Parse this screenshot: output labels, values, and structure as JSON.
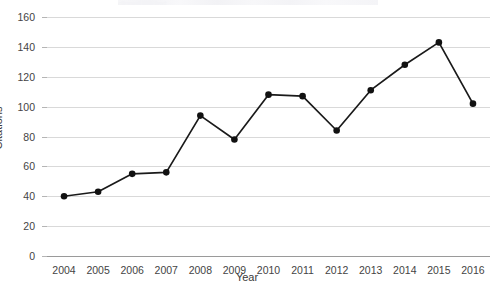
{
  "chart_data": {
    "type": "line",
    "title": "",
    "xlabel": "Year",
    "ylabel": "Citations",
    "categories": [
      "2004",
      "2005",
      "2006",
      "2007",
      "2008",
      "2009",
      "2010",
      "2011",
      "2012",
      "2013",
      "2014",
      "2015",
      "2016"
    ],
    "x": [
      2004,
      2005,
      2006,
      2007,
      2008,
      2009,
      2010,
      2011,
      2012,
      2013,
      2014,
      2015,
      2016
    ],
    "values": [
      40,
      43,
      55,
      56,
      94,
      78,
      108,
      107,
      84,
      111,
      128,
      143,
      102
    ],
    "series": [
      {
        "name": "Citations",
        "values": [
          40,
          43,
          55,
          56,
          94,
          78,
          108,
          107,
          84,
          111,
          128,
          143,
          102
        ]
      }
    ],
    "ylim": [
      0,
      160
    ],
    "yticks": [
      0,
      20,
      40,
      60,
      80,
      100,
      120,
      140,
      160
    ],
    "ytick_labels": [
      "0",
      "20",
      "40",
      "60",
      "80",
      "100",
      "120",
      "140",
      "160"
    ],
    "grid": "horizontal",
    "legend": "none",
    "marker": "filled-circle",
    "line_color": "#1a1a1a",
    "marker_color": "#111111",
    "grid_color": "#d9d9d9",
    "background": "#ffffff"
  },
  "axes": {
    "y_axis_label": "Citations",
    "x_axis_label": "Year"
  },
  "title_remnant": "clipped title text"
}
